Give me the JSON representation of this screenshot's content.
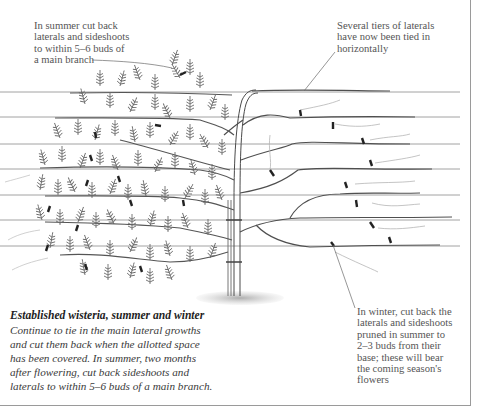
{
  "figure": {
    "wires": [
      92,
      117,
      144,
      169,
      194,
      220,
      246
    ],
    "colors": {
      "ink": "#4a4a4a",
      "foliage": "#6a6a6a",
      "tie": "#222222",
      "text": "#555555",
      "caption_title": "#1e1e1e"
    }
  },
  "annotations": {
    "top_left": {
      "lines": [
        "In summer cut back",
        "laterals and sideshoots",
        "to within 5–6 buds of",
        "a main branch"
      ]
    },
    "top_right": {
      "lines": [
        "Several tiers of laterals",
        "have now been tied in",
        "horizontally"
      ]
    },
    "bottom_right": {
      "lines": [
        "In winter, cut back the",
        "laterals and sideshoots",
        "pruned in summer to",
        "2–3 buds from their",
        "base; these will bear",
        "the coming season's",
        "flowers"
      ]
    }
  },
  "caption": {
    "title": "Established wisteria, summer and winter",
    "lines": [
      "Continue to tie in the main lateral growths",
      "and cut them back when the allotted space",
      "has been covered. In summer, two months",
      "after flowering, cut back sideshoots and",
      "laterals to within 5–6 buds of a main branch."
    ]
  }
}
